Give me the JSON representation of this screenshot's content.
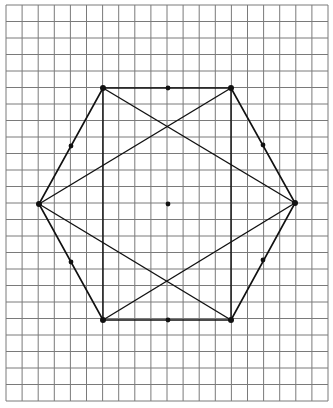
{
  "diagram": {
    "title": "",
    "grid": {
      "x0": 6,
      "x1": 328,
      "cols": 20,
      "y0": 5,
      "y1": 401,
      "rows": 24,
      "color": "#7a7a7a"
    },
    "shape_color": "#111111",
    "vertices": {
      "top_left": [
        103,
        88
      ],
      "top_right": [
        231,
        88
      ],
      "right": [
        295,
        203
      ],
      "bottom_right": [
        231,
        320
      ],
      "bottom_left": [
        103,
        320
      ],
      "left": [
        39,
        204
      ]
    },
    "hexagon_order": [
      "top_left",
      "top_right",
      "right",
      "bottom_right",
      "bottom_left",
      "left"
    ],
    "chords": [
      [
        "top_left",
        "bottom_left"
      ],
      [
        "top_right",
        "bottom_right"
      ],
      [
        "top_left",
        "right"
      ],
      [
        "bottom_left",
        "right"
      ],
      [
        "top_right",
        "left"
      ],
      [
        "bottom_right",
        "left"
      ]
    ],
    "vertex_dots": [
      "top_left",
      "top_right",
      "right",
      "bottom_right",
      "bottom_left",
      "left"
    ],
    "midpoint_dots": [
      [
        168,
        88
      ],
      [
        168,
        320
      ],
      [
        71,
        146
      ],
      [
        71,
        262
      ],
      [
        263,
        145
      ],
      [
        263,
        260
      ],
      [
        168,
        204
      ]
    ]
  }
}
